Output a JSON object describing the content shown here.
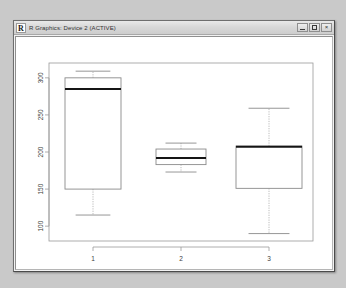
{
  "window": {
    "app_icon_letter": "R",
    "title": "R Graphics: Device 2 (ACTIVE)",
    "controls": {
      "minimize_label": "Minimize",
      "maximize_label": "Maximize",
      "close_label": "Close",
      "close_glyph": "×"
    }
  },
  "chart_data": {
    "type": "boxplot",
    "title": "",
    "xlabel": "",
    "ylabel": "",
    "categories": [
      "1",
      "2",
      "3"
    ],
    "x_tick_labels": [
      "1",
      "2",
      "3"
    ],
    "y_tick_labels": [
      "100",
      "150",
      "200",
      "250",
      "300"
    ],
    "y_ticks": [
      100,
      150,
      200,
      250,
      300
    ],
    "ylim": [
      80,
      320
    ],
    "grid": false,
    "legend": null,
    "boxes": [
      {
        "category": "1",
        "lower_whisker": 115,
        "q1": 150,
        "median": 285,
        "q3": 300,
        "upper_whisker": 309
      },
      {
        "category": "2",
        "lower_whisker": 173,
        "q1": 183,
        "median": 192,
        "q3": 204,
        "upper_whisker": 212
      },
      {
        "category": "3",
        "lower_whisker": 90,
        "q1": 151,
        "median": 207,
        "q3": 208,
        "upper_whisker": 259
      }
    ]
  }
}
